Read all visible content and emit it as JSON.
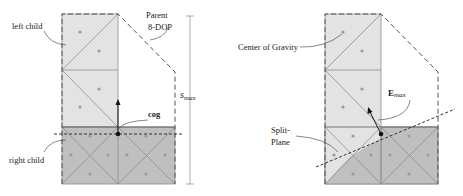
{
  "figure": {
    "left_panel": {
      "labels": {
        "left_child": "left child",
        "right_child": "right child",
        "parent_line1": "Parent",
        "parent_line2": "8-DOP",
        "cog": "cog",
        "smax_main": "s",
        "smax_sub": "max"
      }
    },
    "right_panel": {
      "labels": {
        "center_of_gravity": "Center of Gravity",
        "emax_main": "E",
        "emax_sub": "max",
        "split_line1": "Split-",
        "split_line2": "Plane"
      }
    },
    "colors": {
      "light_fill": "#e3e3e3",
      "dark_fill": "#bfbfbf",
      "edge": "#8e8e8e",
      "dot": "#9a9a9a",
      "background": "#ffffff"
    }
  }
}
